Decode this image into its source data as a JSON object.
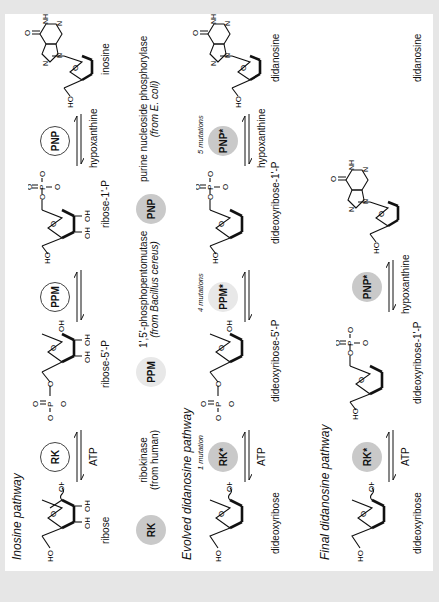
{
  "pathways": [
    {
      "title": "Inosine pathway",
      "substrates": [
        "ribose",
        "ribose-5'-P",
        "ribose-1'-P",
        "inosine"
      ],
      "enzymes": [
        {
          "label": "RK",
          "style": "open",
          "cofactor": "ATP",
          "mutations": ""
        },
        {
          "label": "PPM",
          "style": "open",
          "cofactor": "",
          "mutations": ""
        },
        {
          "label": "PNP",
          "style": "open",
          "cofactor": "hypoxanthine",
          "mutations": ""
        }
      ]
    },
    {
      "title": "Evolved didanosine pathway",
      "substrates": [
        "dideoxyribose",
        "dideoxyribose-5'-P",
        "dideoxyribose-1'-P",
        "didanosine"
      ],
      "enzymes": [
        {
          "label": "RK*",
          "style": "fill",
          "cofactor": "ATP",
          "mutations": "1 mutation"
        },
        {
          "label": "PPM*",
          "style": "faint",
          "cofactor": "",
          "mutations": "4 mutations"
        },
        {
          "label": "PNP*",
          "style": "fill",
          "cofactor": "hypoxanthine",
          "mutations": "5 mutations"
        }
      ]
    },
    {
      "title": "Final didanosine pathway",
      "substrates": [
        "dideoxyribose",
        "dideoxyribose-1'-P",
        "didanosine"
      ],
      "enzymes": [
        {
          "label": "RK*",
          "style": "fill",
          "cofactor": "ATP",
          "mutations": ""
        },
        {
          "label": "PNP*",
          "style": "fill",
          "cofactor": "hypoxanthine",
          "mutations": ""
        }
      ]
    }
  ],
  "legend": [
    {
      "label": "RK",
      "name": "ribokinase",
      "source": "(from human)"
    },
    {
      "label": "PPM",
      "name": "1',5'-phosphopentomutase",
      "source": "(from Bacillus cereus)"
    },
    {
      "label": "PNP",
      "name": "purine nucleoside phosphorylase",
      "source": "(from E. coli)"
    }
  ],
  "atoms": {
    "oh": "OH",
    "ho": "HO",
    "o": "O",
    "p": "P",
    "n": "N",
    "nh": "NH",
    "minus": "−"
  }
}
